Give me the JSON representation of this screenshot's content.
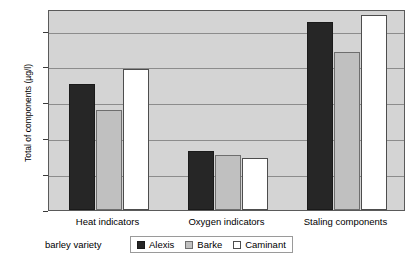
{
  "chart_data": {
    "type": "bar",
    "title": "",
    "categories": [
      "Heat indicators",
      "Oxygen indicators",
      "Staling components"
    ],
    "series": [
      {
        "name": "Alexis",
        "values": [
          88,
          41,
          131
        ]
      },
      {
        "name": "Barke",
        "values": [
          70,
          38,
          110
        ]
      },
      {
        "name": "Caminant",
        "values": [
          98,
          36,
          136
        ]
      }
    ],
    "xlabel": "barley variety",
    "ylabel": "Total of components (µg/l)",
    "ylim": [
      0,
      140
    ],
    "yticks": [
      0,
      25,
      50,
      75,
      100,
      125
    ],
    "ytick_labels": [
      "0",
      "25",
      "50",
      "75",
      "100",
      "125"
    ],
    "grid": true,
    "legend_position": "bottom",
    "colors": {
      "Alexis": "#262626",
      "Barke": "#c0c0c0",
      "Caminant": "#ffffff",
      "plot_background": "#d4d4d4",
      "gridline": "#8c8c8c",
      "frame": "#5a5a5a"
    }
  }
}
